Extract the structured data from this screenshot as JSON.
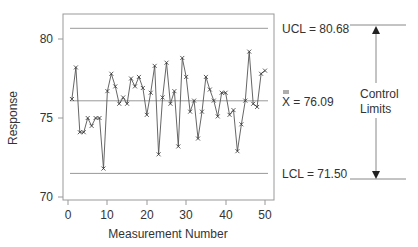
{
  "chart_data": {
    "type": "line",
    "title": "",
    "xlabel": "Measurement Number",
    "ylabel": "Response",
    "xlim": [
      -1,
      52
    ],
    "ylim": [
      69.8,
      81.5
    ],
    "xticks": [
      0,
      10,
      20,
      30,
      40,
      50
    ],
    "yticks": [
      70,
      75,
      80
    ],
    "grid": false,
    "marker": "x",
    "x": [
      1,
      2,
      3,
      4,
      5,
      6,
      7,
      8,
      9,
      10,
      11,
      12,
      13,
      14,
      15,
      16,
      17,
      18,
      19,
      20,
      21,
      22,
      23,
      24,
      25,
      26,
      27,
      28,
      29,
      30,
      31,
      32,
      33,
      34,
      35,
      36,
      37,
      38,
      39,
      40,
      41,
      42,
      43,
      44,
      45,
      46,
      47,
      48,
      49,
      50
    ],
    "series": [
      {
        "name": "Response",
        "values": [
          76.2,
          78.2,
          74.1,
          74.1,
          75.0,
          74.5,
          75.0,
          75.0,
          71.8,
          76.7,
          77.8,
          77.0,
          75.9,
          76.3,
          75.9,
          77.5,
          77.0,
          77.6,
          76.9,
          75.2,
          76.6,
          78.3,
          72.7,
          76.3,
          78.5,
          75.9,
          76.7,
          73.2,
          78.8,
          77.6,
          75.4,
          76.1,
          73.7,
          75.4,
          77.6,
          76.8,
          76.1,
          75.1,
          76.6,
          76.6,
          75.2,
          75.5,
          72.9,
          74.6,
          76.1,
          79.2,
          75.9,
          75.7,
          77.8,
          78.0
        ]
      }
    ],
    "reference_lines": [
      {
        "name": "UCL",
        "value": 80.68,
        "label": "UCL = 80.68"
      },
      {
        "name": "center",
        "value": 76.09,
        "label": "X = 76.09",
        "label_symbol": "double-bar X"
      },
      {
        "name": "LCL",
        "value": 71.5,
        "label": "LCL = 71.50"
      }
    ],
    "annotations": [
      {
        "text": "Control Limits",
        "type": "double-arrow",
        "from": "UCL",
        "to": "LCL"
      }
    ]
  },
  "labels": {
    "ucl": "UCL = 80.68",
    "center_prefix": "X",
    "center_value": " = 76.09",
    "lcl": "LCL = 71.50",
    "control_line1": "Control",
    "control_line2": "Limits",
    "xlabel": "Measurement Number",
    "ylabel": "Response",
    "ytick_80": "80",
    "ytick_75": "75",
    "ytick_70": "70",
    "xtick_0": "0",
    "xtick_10": "10",
    "xtick_20": "20",
    "xtick_30": "30",
    "xtick_40": "40",
    "xtick_50": "50"
  },
  "colors": {
    "line": "#555555",
    "axis": "#888888",
    "reference": "#888888",
    "text": "#333333"
  }
}
